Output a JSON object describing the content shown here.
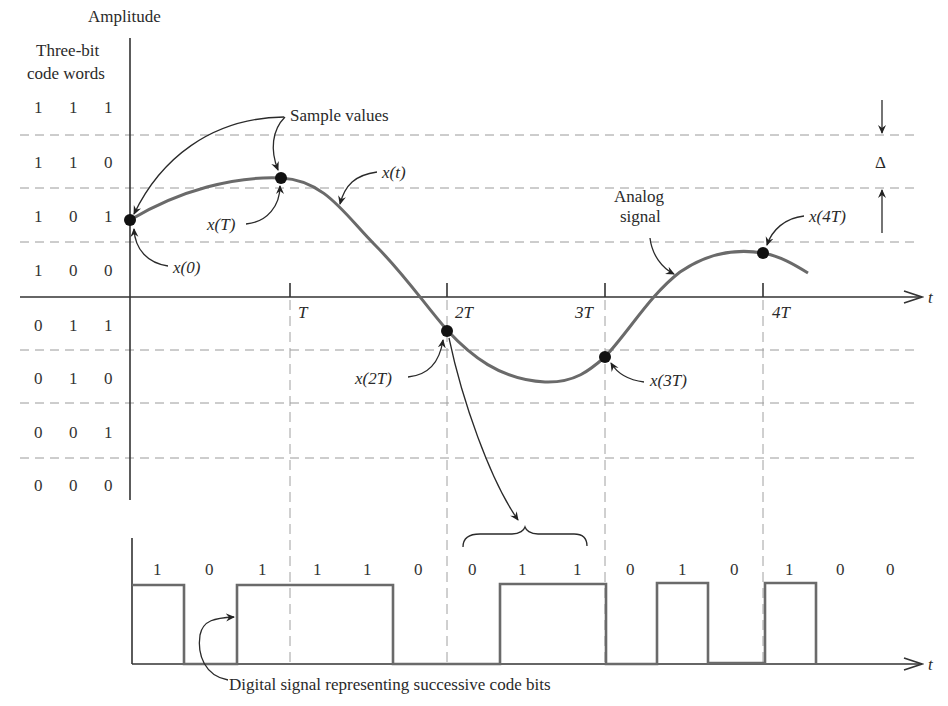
{
  "figure": {
    "y_axis_label": "Amplitude",
    "codeword_header_line1": "Three-bit",
    "codeword_header_line2": "code words",
    "time_axis_label": "t",
    "time_axis_label_digital": "t",
    "delta_label": "Δ",
    "annotations": {
      "sample_values": "Sample values",
      "x_t": "x(t)",
      "analog_signal_line1": "Analog",
      "analog_signal_line2": "signal",
      "digital_signal": "Digital signal representing successive code bits"
    },
    "sample_labels": [
      "x(0)",
      "x(T)",
      "x(2T)",
      "x(3T)",
      "x(4T)"
    ],
    "time_ticks": [
      "T",
      "2T",
      "3T",
      "4T"
    ],
    "code_words": [
      [
        "1",
        "1",
        "1"
      ],
      [
        "1",
        "1",
        "0"
      ],
      [
        "1",
        "0",
        "1"
      ],
      [
        "1",
        "0",
        "0"
      ],
      [
        "0",
        "1",
        "1"
      ],
      [
        "0",
        "1",
        "0"
      ],
      [
        "0",
        "0",
        "1"
      ],
      [
        "0",
        "0",
        "0"
      ]
    ],
    "bit_stream": [
      "1",
      "0",
      "1",
      "1",
      "1",
      "0",
      "0",
      "1",
      "1",
      "0",
      "1",
      "0",
      "1",
      "0",
      "0"
    ],
    "colors": {
      "curve": "#6a6a6a",
      "axis": "#333333",
      "grid": "#9a9a9a",
      "sample_dot": "#111111"
    }
  }
}
